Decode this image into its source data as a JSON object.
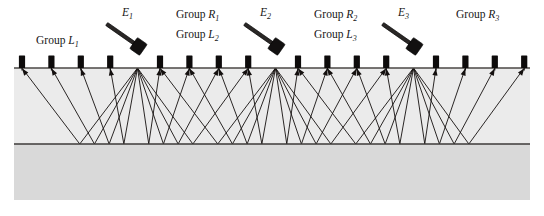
{
  "figure": {
    "width": 544,
    "height": 216,
    "background_color": "#ffffff"
  },
  "colors": {
    "upper_layer": "#ebebeb",
    "lower_layer": "#d9d9d9",
    "ray": "#14100f",
    "surface_line": "#4a4745",
    "reflector_line": "#3c3a38",
    "geophone": "#0d0b0b",
    "hammer_head": "#121010",
    "hammer_handle": "#2a2726",
    "text": "#161616"
  },
  "geometry": {
    "surface_y": 68,
    "reflector_y": 144,
    "layer_bottom_y": 200,
    "layer_left_x": 14,
    "layer_right_x": 530,
    "geophone_spacing": 29.4,
    "geophone_first_x": 22,
    "geophone_count": 16,
    "shot_count": 3,
    "geophones_per_shot": 8
  },
  "labels": {
    "group_L1": "Group L",
    "group_L1_sub": "1",
    "group_R1": "Group R",
    "group_R1_sub": "1",
    "group_L2": "Group L",
    "group_L2_sub": "2",
    "group_R2": "Group R",
    "group_R2_sub": "2",
    "group_L3": "Group L",
    "group_L3_sub": "3",
    "group_R3": "Group R",
    "group_R3_sub": "3",
    "shot_E1": "E",
    "shot_E1_sub": "1",
    "shot_E2": "E",
    "shot_E2_sub": "2",
    "shot_E3": "E",
    "shot_E3_sub": "3"
  },
  "shots": [
    {
      "id": "E1",
      "x": 137.5,
      "y": 68,
      "label": "E",
      "sub": "1",
      "hammer_label_x": 122,
      "hammer_label_y": 16,
      "hammer_x": 108,
      "hammer_y": 22,
      "hammer_angle": 35
    },
    {
      "id": "E2",
      "x": 275.5,
      "y": 68,
      "label": "E",
      "sub": "2",
      "hammer_label_x": 260,
      "hammer_label_y": 16,
      "hammer_x": 246,
      "hammer_y": 22,
      "hammer_angle": 35
    },
    {
      "id": "E3",
      "x": 413.5,
      "y": 68,
      "label": "E",
      "sub": "3",
      "hammer_label_x": 398,
      "hammer_label_y": 16,
      "hammer_x": 384,
      "hammer_y": 22,
      "hammer_angle": 35
    }
  ],
  "geophone_positions": [
    22.0,
    51.4,
    80.8,
    110.2,
    160.0,
    189.4,
    218.8,
    248.2,
    298.0,
    327.4,
    356.8,
    386.2,
    436.0,
    465.4,
    494.8,
    524.2
  ],
  "group_labels": [
    {
      "key": "L1",
      "text": "Group L",
      "sub": "1",
      "x": 36,
      "y": 44
    },
    {
      "key": "R1",
      "text": "Group R",
      "sub": "1",
      "x": 176,
      "y": 18
    },
    {
      "key": "L2",
      "text": "Group L",
      "sub": "2",
      "x": 176,
      "y": 38
    },
    {
      "key": "R2",
      "text": "Group R",
      "sub": "2",
      "x": 314,
      "y": 18
    },
    {
      "key": "L3",
      "text": "Group L",
      "sub": "3",
      "x": 314,
      "y": 38
    },
    {
      "key": "R3",
      "text": "Group R",
      "sub": "3",
      "x": 456,
      "y": 18
    }
  ]
}
